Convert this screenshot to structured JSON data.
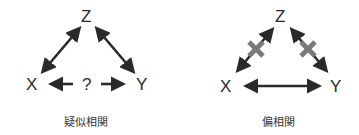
{
  "diagrams": [
    {
      "caption": "疑似相関",
      "nodes": {
        "z": "Z",
        "x": "X",
        "y": "Y"
      },
      "middle_label": "?",
      "edges": [
        {
          "from": "Z",
          "to": "X",
          "type": "bidirectional"
        },
        {
          "from": "Z",
          "to": "Y",
          "type": "bidirectional"
        },
        {
          "from": "?",
          "to": "X",
          "type": "arrow"
        },
        {
          "from": "?",
          "to": "Y",
          "type": "arrow"
        }
      ]
    },
    {
      "caption": "偏相関",
      "nodes": {
        "z": "Z",
        "x": "X",
        "y": "Y"
      },
      "edges": [
        {
          "from": "Z",
          "to": "X",
          "type": "bidirectional",
          "crossed_out": true
        },
        {
          "from": "Z",
          "to": "Y",
          "type": "bidirectional",
          "crossed_out": true
        },
        {
          "from": "X",
          "to": "Y",
          "type": "bidirectional"
        }
      ]
    }
  ],
  "colors": {
    "arrow": "#2a2a2a",
    "cross": "#7a7a7a",
    "text": "#2b2b2b"
  }
}
